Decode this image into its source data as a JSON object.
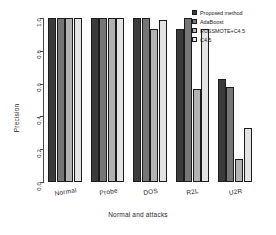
{
  "chart_data": {
    "type": "bar",
    "title": "",
    "xlabel": "Normal and attacks",
    "ylabel": "Precision",
    "categories": [
      "Normal",
      "Probe",
      "DOS",
      "R2L",
      "U2R"
    ],
    "series": [
      {
        "name": "Proposed method",
        "color": "#3b3b3b",
        "values": [
          1.0,
          1.0,
          1.0,
          0.93,
          0.63
        ]
      },
      {
        "name": "AdaBoost",
        "color": "#767676",
        "values": [
          1.0,
          1.0,
          1.0,
          1.0,
          0.58
        ]
      },
      {
        "name": "RUSSMOTE+C4.5",
        "color": "#b2b2b2",
        "values": [
          1.0,
          1.0,
          0.93,
          0.57,
          0.14
        ]
      },
      {
        "name": "C4.5",
        "color": "#e3e3e3",
        "values": [
          1.0,
          1.0,
          0.99,
          0.93,
          0.33
        ]
      }
    ],
    "ylim": [
      0.0,
      1.0
    ],
    "yticks": [
      "1.0",
      "0.8",
      "0.6",
      "0.4",
      "0.2",
      "0.0"
    ],
    "ytick_values": [
      1.0,
      0.8,
      0.6,
      0.4,
      0.2,
      0.0
    ],
    "grid": false,
    "legend_position": "top-right"
  },
  "legend": {
    "entries": [
      {
        "label": "Proposed method"
      },
      {
        "label": "AdaBoost"
      },
      {
        "label": "RUSSMOTE+C4.5"
      },
      {
        "label": "C4.5"
      }
    ]
  }
}
